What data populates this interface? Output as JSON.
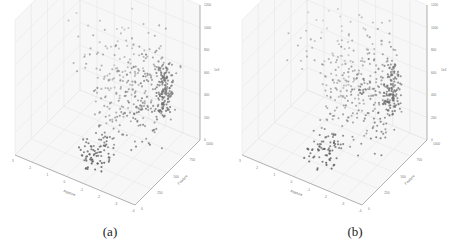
{
  "figure": {
    "panels": [
      {
        "id": "a",
        "caption": "(a)"
      },
      {
        "id": "b",
        "caption": "(b)"
      }
    ]
  },
  "chart_data": [
    {
      "type": "scatter",
      "projection": "3d",
      "title": "",
      "xlabel": "Feature",
      "ylabel": "Feature",
      "zlabel": "",
      "x_ticks": [
        "-4",
        "-3",
        "-2",
        "-1",
        "0",
        "1",
        "2",
        "3"
      ],
      "y_ticks": [
        "0",
        "250",
        "500",
        "750",
        "1000"
      ],
      "z_ticks": [
        "0",
        "200",
        "400",
        "600",
        "800",
        "1000",
        "1200"
      ],
      "z_offset_label": "1e3",
      "xlim": [
        -4,
        3
      ],
      "ylim": [
        0,
        1000
      ],
      "zlim": [
        0,
        1200
      ],
      "grid": true,
      "marker_color": "#3a3a3a",
      "seed": 7,
      "n_points": 520
    },
    {
      "type": "scatter",
      "projection": "3d",
      "title": "",
      "xlabel": "Feature",
      "ylabel": "Feature",
      "zlabel": "",
      "x_ticks": [
        "-4",
        "-3",
        "-2",
        "-1",
        "0",
        "1",
        "2",
        "3"
      ],
      "y_ticks": [
        "0",
        "250",
        "500",
        "750",
        "1000"
      ],
      "z_ticks": [
        "0",
        "200",
        "400",
        "600",
        "800",
        "1000",
        "1200"
      ],
      "z_offset_label": "1e3",
      "xlim": [
        -4,
        3
      ],
      "ylim": [
        0,
        1000
      ],
      "zlim": [
        0,
        1200
      ],
      "grid": true,
      "marker_color": "#3a3a3a",
      "seed": 11,
      "n_points": 520
    }
  ]
}
